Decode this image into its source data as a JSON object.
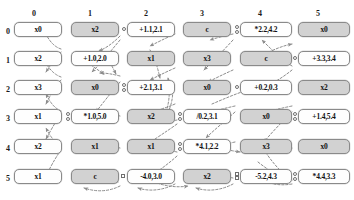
{
  "diagram": {
    "grid": {
      "columns": 6,
      "rows": 6
    },
    "column_headers": [
      "0",
      "1",
      "2",
      "3",
      "4",
      "5"
    ],
    "row_headers": [
      "0",
      "1",
      "2",
      "3",
      "4",
      "5"
    ],
    "colors": {
      "node_active_fill": "#fefefe",
      "node_inactive_fill": "#d2d2d2",
      "node_border": "#8a8a8a",
      "edge": "#8c8c8c",
      "text": "#111111"
    },
    "legend_note": "white nodes are active/expressed, gray nodes are inactive",
    "nodes": [
      [
        {
          "label": "x0",
          "state": "white"
        },
        {
          "label": "x2",
          "state": "gray"
        },
        {
          "label": "+1.1,2.1",
          "state": "white"
        },
        {
          "label": "c",
          "state": "gray"
        },
        {
          "label": "*2.2,4.2",
          "state": "white"
        },
        {
          "label": "x0",
          "state": "gray"
        }
      ],
      [
        {
          "label": "x2",
          "state": "white"
        },
        {
          "label": "+1.0,2.0",
          "state": "white"
        },
        {
          "label": "x1",
          "state": "gray"
        },
        {
          "label": "x3",
          "state": "gray"
        },
        {
          "label": "c",
          "state": "gray"
        },
        {
          "label": "+3.3,3.4",
          "state": "white"
        }
      ],
      [
        {
          "label": "x3",
          "state": "white"
        },
        {
          "label": "x0",
          "state": "gray"
        },
        {
          "label": "+2.1,3.1",
          "state": "white"
        },
        {
          "label": "x0",
          "state": "gray"
        },
        {
          "label": "+0.2,0.3",
          "state": "white"
        },
        {
          "label": "x2",
          "state": "gray"
        }
      ],
      [
        {
          "label": "x1",
          "state": "white"
        },
        {
          "label": "*1.0,5.0",
          "state": "white"
        },
        {
          "label": "x2",
          "state": "gray"
        },
        {
          "label": "/0.2,3.1",
          "state": "white"
        },
        {
          "label": "x0",
          "state": "gray"
        },
        {
          "label": "+1.4,5.4",
          "state": "white"
        }
      ],
      [
        {
          "label": "x2",
          "state": "white"
        },
        {
          "label": "x1",
          "state": "gray"
        },
        {
          "label": "x1",
          "state": "gray"
        },
        {
          "label": "*4.1,2.2",
          "state": "white"
        },
        {
          "label": "x3",
          "state": "gray"
        },
        {
          "label": "x0",
          "state": "gray"
        }
      ],
      [
        {
          "label": "x1",
          "state": "white"
        },
        {
          "label": "c",
          "state": "gray"
        },
        {
          "label": "-4.0,3.0",
          "state": "white"
        },
        {
          "label": "x2",
          "state": "gray"
        },
        {
          "label": "-5.2,4.3",
          "state": "white"
        },
        {
          "label": "*4.4,3.3",
          "state": "white"
        }
      ]
    ]
  }
}
